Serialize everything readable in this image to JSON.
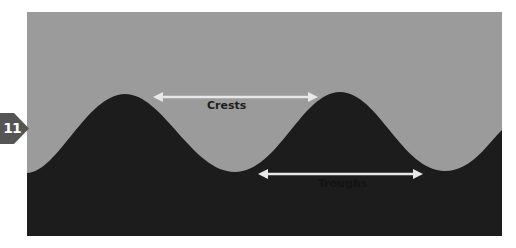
{
  "badge": {
    "number": "11",
    "color": "#555555"
  },
  "diagram": {
    "background_color": "#9b9b9b",
    "wave_color": "#1c1c1c",
    "arrow_color": "#e8e8e8",
    "labels": {
      "crests": "Crests",
      "troughs": "Troughs"
    }
  }
}
